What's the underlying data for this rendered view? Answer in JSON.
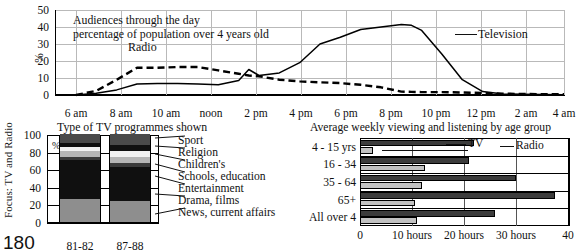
{
  "focus_label": "Focus: TV and Radio",
  "page_number": "180",
  "line_chart": {
    "caption_line1": "Audiences through the day",
    "caption_line2": "percentage of population over 4 years old",
    "y_axis_label": "%",
    "annotations": {
      "radio": "Radio",
      "television": "Television"
    },
    "chart_data": {
      "type": "line",
      "title": "Audiences through the day",
      "subtitle": "percentage of population over 4 years old",
      "xlabel": "",
      "ylabel": "%",
      "ylim": [
        0,
        50
      ],
      "yticks": [
        0,
        10,
        20,
        30,
        40,
        50
      ],
      "xticks": [
        "6 am",
        "8 am",
        "10 am",
        "noon",
        "2 pm",
        "4 pm",
        "6 pm",
        "8 pm",
        "10 pm",
        "12 pm",
        "2 am",
        "4 am"
      ],
      "grid": true,
      "legend": "inline-annotation",
      "x": [
        5,
        6,
        7,
        8,
        9,
        10,
        11,
        12,
        13,
        13.5,
        14,
        15,
        16,
        17,
        18,
        19,
        20,
        21,
        21.5,
        22,
        23,
        24,
        25,
        26,
        27,
        28,
        29
      ],
      "series": [
        {
          "name": "Television",
          "style": "solid",
          "values": [
            0,
            1,
            3,
            6.5,
            6.7,
            6.7,
            6.5,
            6.0,
            8.5,
            15,
            11.5,
            13,
            19,
            30,
            34,
            38.5,
            40,
            41.5,
            41,
            38,
            24,
            9,
            2,
            0.6,
            0.4,
            0.3,
            0.2
          ]
        },
        {
          "name": "Radio",
          "style": "dashed",
          "values": [
            0,
            2.5,
            9,
            16,
            16,
            16.5,
            16.5,
            14.5,
            12.5,
            11.5,
            11,
            9,
            8,
            7.5,
            7,
            6,
            4.5,
            2,
            1.8,
            1.7,
            1.7,
            1.5,
            1.2,
            0.8,
            0.6,
            0.5,
            0.4
          ]
        }
      ]
    }
  },
  "stack_chart": {
    "title": "Type of TV programmes shown",
    "y_axis_label": "%",
    "chart_data": {
      "type": "bar",
      "subtype": "stacked-100",
      "title": "Type of TV programmes shown",
      "ylabel": "%",
      "ylim": [
        0,
        100
      ],
      "yticks": [
        0,
        20,
        40,
        60,
        80,
        100
      ],
      "categories": [
        "81-82",
        "87-88"
      ],
      "series": [
        {
          "name": "News, current affairs",
          "color": "#8e8e8e",
          "values": [
            26,
            24
          ]
        },
        {
          "name": "Drama, films",
          "color": "#101010",
          "values": [
            45,
            38
          ]
        },
        {
          "name": "Entertainment",
          "color": "#3a3a3a",
          "values": [
            3,
            5
          ]
        },
        {
          "name": "Schools, education",
          "color": "#b6b6b6",
          "values": [
            7,
            7
          ]
        },
        {
          "name": "Children's",
          "color": "#f2f2f2",
          "values": [
            4,
            7
          ]
        },
        {
          "name": "Religion",
          "color": "#101010",
          "values": [
            5,
            6
          ]
        },
        {
          "name": "Sport",
          "color": "#4a4a4a",
          "values": [
            10,
            13
          ]
        }
      ],
      "legend_labels": [
        "Sport",
        "Religion",
        "Children's",
        "Schools, education",
        "Entertainment",
        "Drama, films",
        "News, current affairs"
      ]
    }
  },
  "hbar_chart": {
    "title": "Average weekly viewing and listening by age group",
    "key_tv": "TV",
    "key_radio": "Radio",
    "chart_data": {
      "type": "bar",
      "subtype": "grouped-horizontal",
      "title": "Average weekly viewing and listening by age group",
      "xlabel": "",
      "xlim": [
        0,
        40
      ],
      "xticks": [
        0,
        10,
        20,
        30,
        40
      ],
      "xticklabels": [
        "0",
        "10 hours",
        "20 hours",
        "30 hours",
        "40"
      ],
      "categories": [
        "4 - 15 yrs",
        "16 - 34",
        "35 - 64",
        "65+",
        "All over 4"
      ],
      "series": [
        {
          "name": "TV",
          "color": "#3c3c3c",
          "values": [
            22.0,
            21.0,
            30.0,
            37.5,
            26.0
          ]
        },
        {
          "name": "Radio",
          "color": "#c2c2c2",
          "values": [
            2.5,
            12.5,
            12.0,
            10.5,
            11.0
          ]
        }
      ]
    }
  }
}
